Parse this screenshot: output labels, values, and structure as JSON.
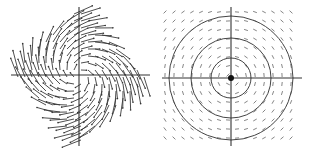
{
  "figure": {
    "panels": [
      {
        "id": "left",
        "description": "Spiral vector field inside a diamond-shaped (rotated square) region",
        "center": [
          79,
          75
        ],
        "axis": {
          "h": [
            11,
            150
          ],
          "v": [
            7,
            146
          ]
        },
        "field_type": "spiral",
        "half_extent": 48,
        "grid_step": 7,
        "colors": {
          "arrows": "#3a3a3a",
          "axes": "#333333"
        }
      },
      {
        "id": "right",
        "description": "Rotational (circular) vector field with concentric circular trajectories and a fixed point at origin",
        "center": [
          231,
          78
        ],
        "axis": {
          "h": [
            162,
            302
          ],
          "v": [
            7,
            146
          ]
        },
        "field_type": "rotation",
        "half_extent": 66,
        "grid_step": 9,
        "circles": [
          20,
          40,
          62
        ],
        "center_dot_radius": 3,
        "colors": {
          "arrows": "#777777",
          "circles": "#444444",
          "axes": "#333333",
          "dot": "#111111"
        }
      }
    ]
  }
}
